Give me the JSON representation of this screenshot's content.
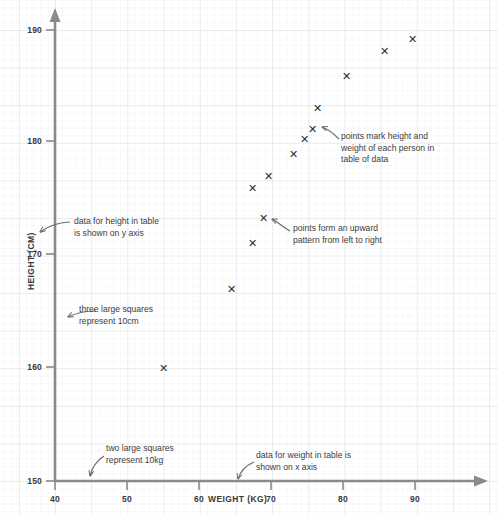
{
  "chart_data": {
    "type": "scatter",
    "title": "",
    "xlabel": "WEIGHT (KG)",
    "ylabel": "HEIGHT (CM)",
    "xlim": [
      40,
      92
    ],
    "ylim": [
      150,
      191
    ],
    "xticks": [
      40,
      50,
      60,
      70,
      80,
      90
    ],
    "yticks": [
      150,
      160,
      170,
      180,
      190
    ],
    "xtick_labels": [
      "40",
      "50",
      "60",
      "70",
      "80",
      "90"
    ],
    "ytick_labels": [
      "150",
      "160",
      "170",
      "180",
      "190"
    ],
    "grid": true,
    "marker": "x",
    "marker_color": "#2d2d2d",
    "axis_color": "#8a8a8a",
    "points": [
      {
        "weight": 55.0,
        "height": 160.0
      },
      {
        "weight": 64.4,
        "height": 167.0
      },
      {
        "weight": 67.3,
        "height": 171.1
      },
      {
        "weight": 68.8,
        "height": 173.3
      },
      {
        "weight": 67.3,
        "height": 176.0
      },
      {
        "weight": 69.5,
        "height": 177.0
      },
      {
        "weight": 73.0,
        "height": 179.0
      },
      {
        "weight": 74.5,
        "height": 180.3
      },
      {
        "weight": 75.6,
        "height": 181.2
      },
      {
        "weight": 76.3,
        "height": 183.1
      },
      {
        "weight": 80.3,
        "height": 185.9
      },
      {
        "weight": 85.5,
        "height": 188.1
      },
      {
        "weight": 89.4,
        "height": 189.2
      }
    ]
  },
  "annotations": [
    {
      "id": "height-y-axis",
      "lines": [
        "data for height in table",
        "is shown on y axis"
      ]
    },
    {
      "id": "three-large-squares",
      "lines": [
        "three large squares",
        "represent 10cm"
      ]
    },
    {
      "id": "two-large-squares",
      "lines": [
        "two large squares",
        "represent 10kg"
      ]
    },
    {
      "id": "weight-x-axis",
      "lines": [
        "data for weight in table is",
        "shown on x axis"
      ]
    },
    {
      "id": "points-mark",
      "lines": [
        "points mark height and",
        "weight of each person in",
        "table of data"
      ]
    },
    {
      "id": "upward-pattern",
      "lines": [
        "points form an upward",
        "pattern from left to right"
      ]
    }
  ]
}
